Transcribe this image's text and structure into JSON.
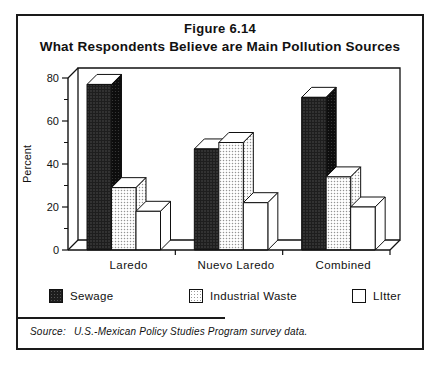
{
  "figure": {
    "title_line1": "Figure 6.14",
    "title_line2": "What Respondents Believe are Main Pollution Sources",
    "source_label": "Source:",
    "source_text": "U.S.-Mexican Policy Studies Program survey data."
  },
  "chart_data": {
    "type": "bar",
    "style": "3d-grouped-bars",
    "title": "Figure 6.14",
    "subtitle": "What Respondents Believe are Main Pollution Sources",
    "categories": [
      "Laredo",
      "Nuevo Laredo",
      "Combined"
    ],
    "series": [
      {
        "name": "Sewage",
        "values": [
          77,
          47,
          71
        ],
        "pattern": "dark-halftone",
        "color": "#1e1e1e"
      },
      {
        "name": "Industrial Waste",
        "values": [
          29,
          50,
          34
        ],
        "pattern": "light-halftone",
        "color": "#cccccc"
      },
      {
        "name": "LItter",
        "values": [
          18,
          22,
          20
        ],
        "pattern": "none",
        "color": "#ffffff"
      }
    ],
    "xlabel": "",
    "ylabel": "Percent",
    "ylim": [
      0,
      80
    ],
    "yticks_major": [
      0,
      20,
      40,
      60,
      80
    ],
    "yticks_minor": [
      10,
      30,
      50,
      70
    ],
    "grid": false,
    "legend_position": "bottom",
    "source": "Source: U.S.-Mexican Policy Studies Program survey data."
  }
}
